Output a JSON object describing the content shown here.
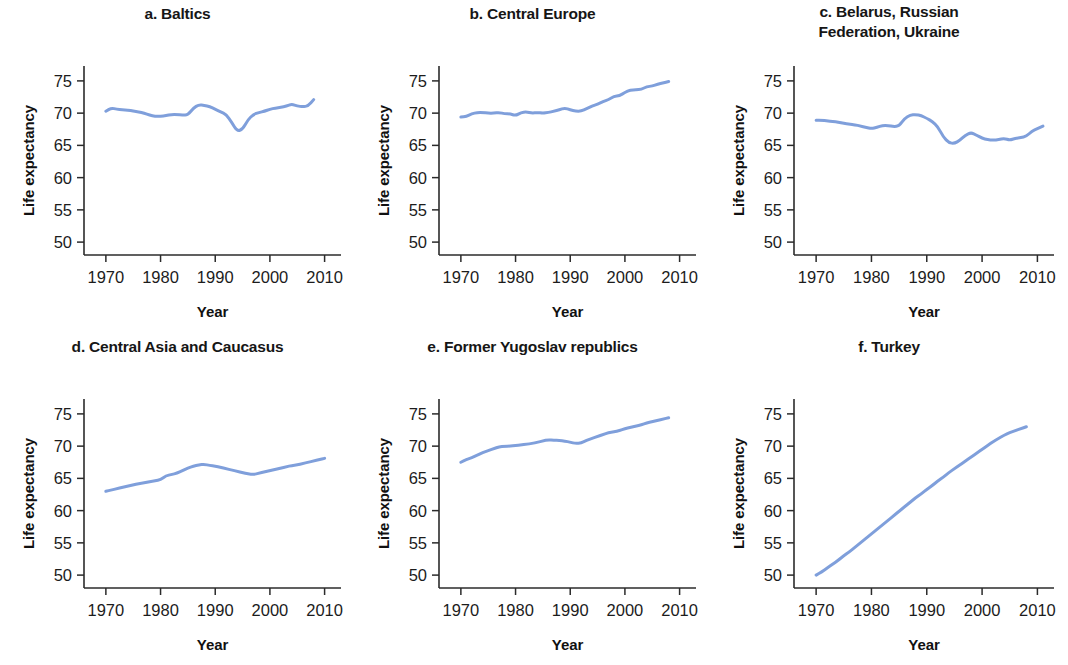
{
  "figure": {
    "background": "#ffffff",
    "line_color": "#7f9fdb",
    "axis_color": "#2b2b2b",
    "panel_count": 6
  },
  "chart_data": [
    {
      "type": "line",
      "title": "a. Baltics",
      "xlabel": "Year",
      "ylabel": "Life expectancy",
      "xlim": [
        1966,
        2013
      ],
      "ylim": [
        48,
        77
      ],
      "xticks": [
        1970,
        1980,
        1990,
        2000,
        2010
      ],
      "yticks": [
        50,
        55,
        60,
        65,
        70,
        75
      ],
      "grid": false,
      "legend": "none",
      "x": [
        1970,
        1971,
        1972,
        1973,
        1974,
        1975,
        1976,
        1977,
        1978,
        1979,
        1980,
        1981,
        1982,
        1983,
        1984,
        1985,
        1986,
        1987,
        1988,
        1989,
        1990,
        1991,
        1992,
        1993,
        1994,
        1995,
        1996,
        1997,
        1998,
        1999,
        2000,
        2001,
        2002,
        2003,
        2004,
        2005,
        2006,
        2007,
        2008
      ],
      "values": [
        70.3,
        70.8,
        70.6,
        70.5,
        70.5,
        70.3,
        70.2,
        70.0,
        69.7,
        69.5,
        69.5,
        69.6,
        69.8,
        69.8,
        69.7,
        69.7,
        70.8,
        71.3,
        71.2,
        71.0,
        70.6,
        70.2,
        69.8,
        68.6,
        67.2,
        67.5,
        69.0,
        69.8,
        70.1,
        70.3,
        70.6,
        70.8,
        70.9,
        71.1,
        71.4,
        71.1,
        71.0,
        71.1,
        72.1
      ]
    },
    {
      "type": "line",
      "title": "b. Central Europe",
      "xlabel": "Year",
      "ylabel": "Life expectancy",
      "xlim": [
        1966,
        2013
      ],
      "ylim": [
        48,
        77
      ],
      "xticks": [
        1970,
        1980,
        1990,
        2000,
        2010
      ],
      "yticks": [
        50,
        55,
        60,
        65,
        70,
        75
      ],
      "grid": false,
      "legend": "none",
      "x": [
        1970,
        1971,
        1972,
        1973,
        1974,
        1975,
        1976,
        1977,
        1978,
        1979,
        1980,
        1981,
        1982,
        1983,
        1984,
        1985,
        1986,
        1987,
        1988,
        1989,
        1990,
        1991,
        1992,
        1993,
        1994,
        1995,
        1996,
        1997,
        1998,
        1999,
        2000,
        2001,
        2002,
        2003,
        2004,
        2005,
        2006,
        2007,
        2008
      ],
      "values": [
        69.4,
        69.5,
        69.9,
        70.1,
        70.1,
        70.0,
        70.0,
        70.1,
        69.9,
        69.9,
        69.6,
        70.1,
        70.2,
        70.0,
        70.1,
        70.0,
        70.1,
        70.3,
        70.5,
        70.8,
        70.5,
        70.3,
        70.3,
        70.7,
        71.1,
        71.4,
        71.8,
        72.1,
        72.6,
        72.7,
        73.2,
        73.6,
        73.6,
        73.7,
        74.1,
        74.2,
        74.5,
        74.7,
        74.9
      ]
    },
    {
      "type": "line",
      "title": "c. Belarus, Russian\nFederation, Ukraine",
      "xlabel": "Year",
      "ylabel": "Life expectancy",
      "xlim": [
        1966,
        2013
      ],
      "ylim": [
        48,
        77
      ],
      "xticks": [
        1970,
        1980,
        1990,
        2000,
        2010
      ],
      "yticks": [
        50,
        55,
        60,
        65,
        70,
        75
      ],
      "grid": false,
      "legend": "none",
      "x": [
        1970,
        1971,
        1972,
        1973,
        1974,
        1975,
        1976,
        1977,
        1978,
        1979,
        1980,
        1981,
        1982,
        1983,
        1984,
        1985,
        1986,
        1987,
        1988,
        1989,
        1990,
        1991,
        1992,
        1993,
        1994,
        1995,
        1996,
        1997,
        1998,
        1999,
        2000,
        2001,
        2002,
        2003,
        2004,
        2005,
        2006,
        2007,
        2008,
        2009,
        2010,
        2011
      ],
      "values": [
        68.9,
        68.9,
        68.8,
        68.7,
        68.6,
        68.4,
        68.3,
        68.2,
        68.0,
        67.8,
        67.6,
        67.8,
        68.1,
        68.1,
        67.9,
        68.0,
        69.2,
        69.7,
        69.8,
        69.6,
        69.2,
        68.7,
        67.9,
        66.3,
        65.4,
        65.3,
        65.8,
        66.6,
        67.0,
        66.6,
        66.1,
        65.9,
        65.8,
        65.9,
        66.1,
        65.8,
        66.1,
        66.2,
        66.4,
        67.2,
        67.6,
        68.0
      ]
    },
    {
      "type": "line",
      "title": "d. Central Asia and Caucasus",
      "xlabel": "Year",
      "ylabel": "Life expectancy",
      "xlim": [
        1966,
        2013
      ],
      "ylim": [
        48,
        77
      ],
      "xticks": [
        1970,
        1980,
        1990,
        2000,
        2010
      ],
      "yticks": [
        50,
        55,
        60,
        65,
        70,
        75
      ],
      "grid": false,
      "legend": "none",
      "x": [
        1970,
        1971,
        1972,
        1973,
        1974,
        1975,
        1976,
        1977,
        1978,
        1979,
        1980,
        1981,
        1982,
        1983,
        1984,
        1985,
        1986,
        1987,
        1988,
        1989,
        1990,
        1991,
        1992,
        1993,
        1994,
        1995,
        1996,
        1997,
        1998,
        1999,
        2000,
        2001,
        2002,
        2003,
        2004,
        2005,
        2006,
        2007,
        2008,
        2009,
        2010
      ],
      "values": [
        63.0,
        63.2,
        63.4,
        63.6,
        63.8,
        64.0,
        64.2,
        64.3,
        64.5,
        64.6,
        64.8,
        65.4,
        65.6,
        65.8,
        66.2,
        66.6,
        66.9,
        67.1,
        67.2,
        67.0,
        66.9,
        66.7,
        66.5,
        66.3,
        66.1,
        65.9,
        65.7,
        65.6,
        65.8,
        66.0,
        66.2,
        66.4,
        66.6,
        66.8,
        67.0,
        67.1,
        67.3,
        67.5,
        67.7,
        67.9,
        68.1
      ]
    },
    {
      "type": "line",
      "title": "e. Former Yugoslav republics",
      "xlabel": "Year",
      "ylabel": "Life expectancy",
      "xlim": [
        1966,
        2013
      ],
      "ylim": [
        48,
        77
      ],
      "xticks": [
        1970,
        1980,
        1990,
        2000,
        2010
      ],
      "yticks": [
        50,
        55,
        60,
        65,
        70,
        75
      ],
      "grid": false,
      "legend": "none",
      "x": [
        1970,
        1971,
        1972,
        1973,
        1974,
        1975,
        1976,
        1977,
        1978,
        1979,
        1980,
        1981,
        1982,
        1983,
        1984,
        1985,
        1986,
        1987,
        1988,
        1989,
        1990,
        1991,
        1992,
        1993,
        1994,
        1995,
        1996,
        1997,
        1998,
        1999,
        2000,
        2001,
        2002,
        2003,
        2004,
        2005,
        2006,
        2007,
        2008
      ],
      "values": [
        67.5,
        67.9,
        68.2,
        68.6,
        69.0,
        69.3,
        69.6,
        69.9,
        70.0,
        70.0,
        70.1,
        70.2,
        70.3,
        70.4,
        70.6,
        70.8,
        71.0,
        70.9,
        70.9,
        70.8,
        70.6,
        70.4,
        70.5,
        70.9,
        71.2,
        71.5,
        71.8,
        72.1,
        72.2,
        72.4,
        72.7,
        72.9,
        73.1,
        73.3,
        73.6,
        73.8,
        74.0,
        74.2,
        74.4
      ]
    },
    {
      "type": "line",
      "title": "f. Turkey",
      "xlabel": "Year",
      "ylabel": "Life expectancy",
      "xlim": [
        1966,
        2013
      ],
      "ylim": [
        48,
        77
      ],
      "xticks": [
        1970,
        1980,
        1990,
        2000,
        2010
      ],
      "yticks": [
        50,
        55,
        60,
        65,
        70,
        75
      ],
      "grid": false,
      "legend": "none",
      "x": [
        1970,
        1971,
        1972,
        1973,
        1974,
        1975,
        1976,
        1977,
        1978,
        1979,
        1980,
        1981,
        1982,
        1983,
        1984,
        1985,
        1986,
        1987,
        1988,
        1989,
        1990,
        1991,
        1992,
        1993,
        1994,
        1995,
        1996,
        1997,
        1998,
        1999,
        2000,
        2001,
        2002,
        2003,
        2004,
        2005,
        2006,
        2007,
        2008
      ],
      "values": [
        50.0,
        50.5,
        51.1,
        51.7,
        52.3,
        53.0,
        53.6,
        54.3,
        55.0,
        55.7,
        56.4,
        57.1,
        57.8,
        58.5,
        59.2,
        59.9,
        60.6,
        61.3,
        62.0,
        62.6,
        63.3,
        63.9,
        64.6,
        65.2,
        65.9,
        66.5,
        67.1,
        67.7,
        68.3,
        68.9,
        69.5,
        70.1,
        70.7,
        71.2,
        71.7,
        72.1,
        72.4,
        72.7,
        73.0
      ]
    }
  ]
}
